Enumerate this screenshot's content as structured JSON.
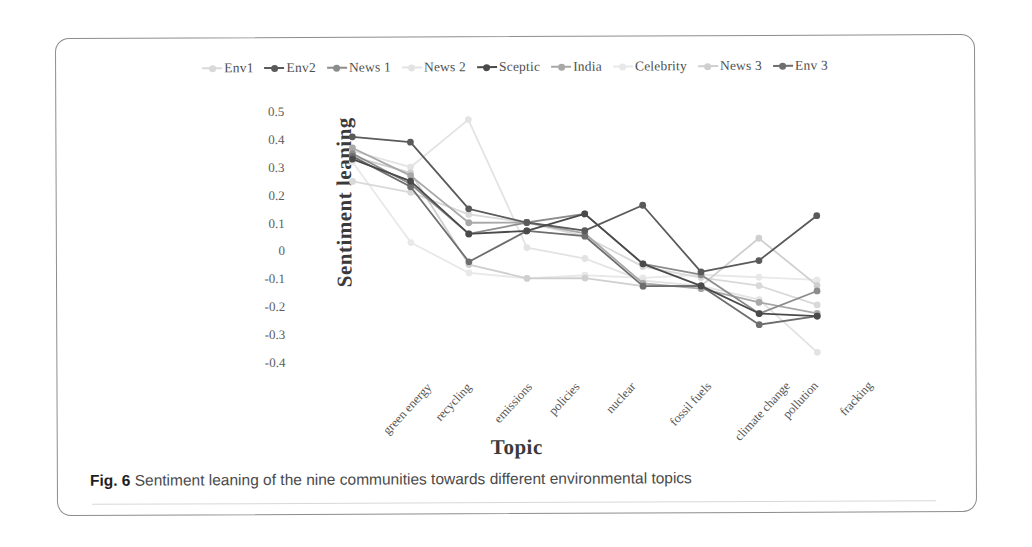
{
  "figure": {
    "caption_number": "Fig. 6",
    "caption_text": "Sentiment leaning of the nine communities towards different environmental topics"
  },
  "chart_data": {
    "type": "line",
    "title": "",
    "xlabel": "Topic",
    "ylabel": "Sentiment leaning",
    "ylim": [
      -0.45,
      0.52
    ],
    "yticks": [
      0.5,
      0.4,
      0.3,
      0.2,
      0.1,
      0,
      -0.1,
      -0.2,
      -0.3,
      -0.4
    ],
    "ytick_labels": [
      "0.5",
      "0.4",
      "0.3",
      "0.2",
      "0.1",
      "0",
      "-0.1",
      "-0.2",
      "-0.3",
      "-0.4"
    ],
    "grid": false,
    "legend_position": "top-center",
    "categories": [
      "green energy",
      "recycling",
      "emissions",
      "policies",
      "nuclear",
      "fossil fuels",
      "climate change",
      "pollution",
      "fracking"
    ],
    "series": [
      {
        "name": "Env1",
        "color": "#d9d9d9",
        "values": [
          0.25,
          0.21,
          0.13,
          0.1,
          0.05,
          -0.06,
          -0.1,
          -0.13,
          -0.2
        ]
      },
      {
        "name": "Env2",
        "color": "#5a5a5a",
        "values": [
          0.41,
          0.39,
          0.15,
          0.1,
          0.07,
          0.16,
          -0.08,
          -0.04,
          0.12
        ]
      },
      {
        "name": "News 1",
        "color": "#8c8c8c",
        "values": [
          0.35,
          0.24,
          0.06,
          0.1,
          0.13,
          -0.05,
          -0.09,
          -0.23,
          -0.15
        ]
      },
      {
        "name": "News 2",
        "color": "#e3e3e3",
        "values": [
          0.36,
          0.3,
          0.47,
          0.01,
          -0.03,
          -0.11,
          -0.13,
          -0.18,
          -0.37
        ]
      },
      {
        "name": "Sceptic",
        "color": "#4a4a4a",
        "values": [
          0.33,
          0.25,
          0.06,
          0.07,
          0.13,
          -0.05,
          -0.13,
          -0.23,
          -0.24
        ]
      },
      {
        "name": "India",
        "color": "#a8a8a8",
        "values": [
          0.37,
          0.27,
          0.1,
          0.1,
          0.06,
          -0.12,
          -0.14,
          -0.19,
          -0.23
        ]
      },
      {
        "name": "Celebrity",
        "color": "#e8e8e8",
        "values": [
          0.32,
          0.03,
          -0.08,
          -0.1,
          -0.09,
          -0.1,
          -0.09,
          -0.1,
          -0.11
        ]
      },
      {
        "name": "News 3",
        "color": "#cfcfcf",
        "values": [
          0.34,
          0.28,
          -0.05,
          -0.1,
          -0.1,
          -0.13,
          -0.13,
          0.04,
          -0.13
        ]
      },
      {
        "name": "Env 3",
        "color": "#6e6e6e",
        "values": [
          0.34,
          0.23,
          -0.04,
          0.07,
          0.05,
          -0.13,
          -0.13,
          -0.27,
          -0.24
        ]
      }
    ]
  }
}
